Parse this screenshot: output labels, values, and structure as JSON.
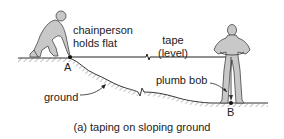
{
  "diagram": {
    "labels": {
      "chainperson_line1": "chainperson",
      "chainperson_line2": "holds flat",
      "tape_line1": "tape",
      "tape_line2": "(level)",
      "plumb_bob": "plumb bob",
      "ground": "ground",
      "point_a": "A",
      "point_b": "B"
    },
    "caption": "(a) taping on sloping ground",
    "colors": {
      "figure_fill": "#c8c8c8",
      "line": "#222222",
      "hatch": "#777777"
    }
  }
}
